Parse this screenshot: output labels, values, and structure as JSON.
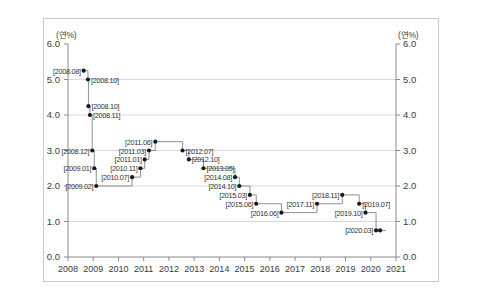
{
  "chart_data": {
    "type": "line",
    "title": "",
    "subtitle": "",
    "xlabel": "",
    "ylabel": "(연%)",
    "ylabel_right": "(연%)",
    "xlim": [
      2008,
      2021
    ],
    "ylim": [
      0.0,
      6.0
    ],
    "grid": true,
    "legend": "none",
    "step_style": "post",
    "y_ticks": [
      "0.0",
      "1.0",
      "2.0",
      "3.0",
      "4.0",
      "5.0",
      "6.0"
    ],
    "y_tick_values": [
      0.0,
      1.0,
      2.0,
      3.0,
      4.0,
      5.0,
      6.0
    ],
    "x_ticks": [
      "2008",
      "2009",
      "2010",
      "2011",
      "2012",
      "2013",
      "2014",
      "2015",
      "2016",
      "2017",
      "2018",
      "2019",
      "2020",
      "2021"
    ],
    "x_tick_values": [
      2008,
      2009,
      2010,
      2011,
      2012,
      2013,
      2014,
      2015,
      2016,
      2017,
      2018,
      2019,
      2020,
      2021
    ],
    "series": [
      {
        "name": "기준금리",
        "points": [
          {
            "label": "[2008.08]",
            "x": 2008.62,
            "y": 5.25,
            "label_pos": "left"
          },
          {
            "label": "[2008.10]",
            "x": 2008.79,
            "y": 5.0,
            "label_pos": "right"
          },
          {
            "label": "[2008.10]",
            "x": 2008.81,
            "y": 4.25,
            "label_pos": "right"
          },
          {
            "label": "[2008.11]",
            "x": 2008.87,
            "y": 4.0,
            "label_pos": "right"
          },
          {
            "label": "[2008.12]",
            "x": 2008.96,
            "y": 3.0,
            "label_pos": "left"
          },
          {
            "label": "[2009.01]",
            "x": 2009.04,
            "y": 2.5,
            "label_pos": "left"
          },
          {
            "label": "[2009.02]",
            "x": 2009.12,
            "y": 2.0,
            "label_pos": "left"
          },
          {
            "label": "[2010.07]",
            "x": 2010.54,
            "y": 2.25,
            "label_pos": "left"
          },
          {
            "label": "[2010.11]",
            "x": 2010.87,
            "y": 2.5,
            "label_pos": "left"
          },
          {
            "label": "[2011.01]",
            "x": 2011.04,
            "y": 2.75,
            "label_pos": "left"
          },
          {
            "label": "[2011.03]",
            "x": 2011.21,
            "y": 3.0,
            "label_pos": "left"
          },
          {
            "label": "[2011.06]",
            "x": 2011.46,
            "y": 3.25,
            "label_pos": "left"
          },
          {
            "label": "[2012.07]",
            "x": 2012.54,
            "y": 3.0,
            "label_pos": "right"
          },
          {
            "label": "[2012.10]",
            "x": 2012.79,
            "y": 2.75,
            "label_pos": "right"
          },
          {
            "label": "[2013.05]",
            "x": 2013.37,
            "y": 2.5,
            "label_pos": "right"
          },
          {
            "label": "[2014.08]",
            "x": 2014.62,
            "y": 2.25,
            "label_pos": "left"
          },
          {
            "label": "[2014.10]",
            "x": 2014.79,
            "y": 2.0,
            "label_pos": "left"
          },
          {
            "label": "[2015.03]",
            "x": 2015.21,
            "y": 1.75,
            "label_pos": "left"
          },
          {
            "label": "[2015.06]",
            "x": 2015.46,
            "y": 1.5,
            "label_pos": "left"
          },
          {
            "label": "[2016.06]",
            "x": 2016.46,
            "y": 1.25,
            "label_pos": "left"
          },
          {
            "label": "[2017.11]",
            "x": 2017.87,
            "y": 1.5,
            "label_pos": "left"
          },
          {
            "label": "[2018.11]",
            "x": 2018.87,
            "y": 1.75,
            "label_pos": "left"
          },
          {
            "label": "[2019.07]",
            "x": 2019.54,
            "y": 1.5,
            "label_pos": "right"
          },
          {
            "label": "[2019.10]",
            "x": 2019.79,
            "y": 1.25,
            "label_pos": "left"
          },
          {
            "label": "[2020.03]",
            "x": 2020.21,
            "y": 0.75,
            "label_pos": "left"
          },
          {
            "label": "",
            "x": 2020.37,
            "y": 0.75,
            "label_pos": "none"
          }
        ]
      }
    ]
  }
}
